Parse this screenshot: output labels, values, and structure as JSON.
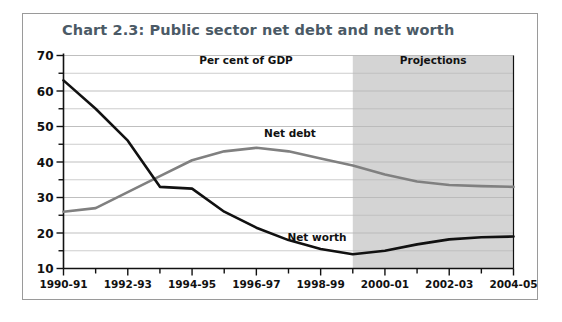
{
  "figure": {
    "title": "Chart 2.3: Public sector net debt and net worth",
    "title_color": "#4b5a66",
    "border_color": "#9a9a9a",
    "background": "#ffffff"
  },
  "annotations": {
    "per_cent_of_gdp": "Per cent of GDP",
    "projections": "Projections",
    "net_debt_label": "Net debt",
    "net_worth_label": "Net worth",
    "projection_band_color": "#d4d4d4",
    "projection_band_start": "1999-2000"
  },
  "chart_data": {
    "type": "line",
    "title": "Chart 2.3: Public sector net debt and net worth",
    "subtitle": "Per cent of GDP",
    "xlabel": "",
    "ylabel": "",
    "ylim": [
      10,
      70
    ],
    "ytick_values": [
      10,
      20,
      30,
      40,
      50,
      60,
      70
    ],
    "ytick_labels": [
      "10",
      "20",
      "30",
      "40",
      "50",
      "60",
      "70"
    ],
    "yminor_step": 5,
    "grid": true,
    "grid_color": "#b8b8b8",
    "legend": "inline-labels",
    "x": [
      "1990-91",
      "1991-92",
      "1992-93",
      "1993-94",
      "1994-95",
      "1995-96",
      "1996-97",
      "1997-98",
      "1998-99",
      "1999-2000",
      "2000-01",
      "2001-02",
      "2002-03",
      "2003-04",
      "2004-05"
    ],
    "xtick_labels": [
      "1990-91",
      "1992-93",
      "1994-95",
      "1996-97",
      "1998-99",
      "2000-01",
      "2002-03",
      "2004-05"
    ],
    "xtick_indices": [
      0,
      2,
      4,
      6,
      8,
      10,
      12,
      14
    ],
    "series": [
      {
        "name": "Net debt",
        "color": "#808080",
        "values": [
          26.0,
          27.0,
          31.5,
          36.0,
          40.5,
          43.0,
          44.0,
          43.0,
          41.0,
          39.0,
          36.5,
          34.5,
          33.5,
          33.2,
          33.0
        ]
      },
      {
        "name": "Net worth",
        "color": "#111111",
        "values": [
          63.0,
          55.0,
          46.0,
          33.0,
          32.5,
          26.0,
          21.5,
          18.0,
          15.5,
          14.0,
          15.0,
          16.8,
          18.2,
          18.8,
          19.0
        ]
      }
    ]
  }
}
